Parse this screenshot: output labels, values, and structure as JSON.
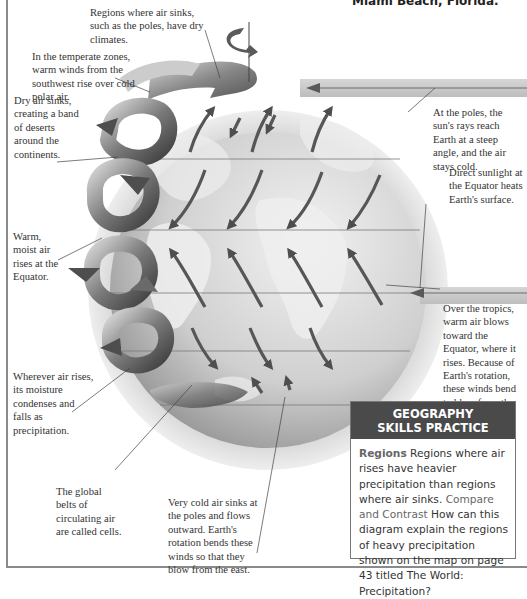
{
  "header": {
    "caption": "Miami Beach, Florida."
  },
  "callouts": {
    "poles_dry": "Regions where air sinks, such as the poles, have dry climates.",
    "temperate": "In the temperate zones, warm winds from the southwest rise over cold polar air.",
    "deserts": "Dry air sinks, creating a band of deserts around the continents.",
    "equator_rise": "Warm, moist air rises at the Equator.",
    "precipitation": "Wherever air rises, its moisture condenses and falls as precipitation.",
    "cells": "The global belts of circulating air are called cells.",
    "polar_sink": "Very cold air sinks at the poles and flows outward. Earth's rotation bends these winds so that they blow from the east.",
    "sun_poles": "At the poles, the sun's rays reach Earth at a steep angle, and the air stays cold.",
    "sun_equator": "Direct sunlight at the Equator heats Earth's surface.",
    "tropics": "Over the tropics, warm air blows toward the Equator, where it rises. Because of Earth's rotation, these winds bend to blow from the southeast or east."
  },
  "skills_box": {
    "title_line1": "GEOGRAPHY",
    "title_line2": "SKILLS PRACTICE",
    "regions_label": "Regions",
    "regions_text": "Regions where air rises have heavier precipitation than regions where air sinks.",
    "compare_label": "Compare and Contrast",
    "compare_text": "How can this diagram explain the regions of heavy precipitation shown on the map on page 43 titled The World: Precipitation?"
  },
  "colors": {
    "header_bg": "#4a4a4a",
    "globe_light": "#e4e4e4",
    "globe_dark": "#9a9a9a",
    "arrow": "#5a5a5a",
    "ribbon_dark": "#555555",
    "ribbon_light": "#cfcfcf"
  }
}
